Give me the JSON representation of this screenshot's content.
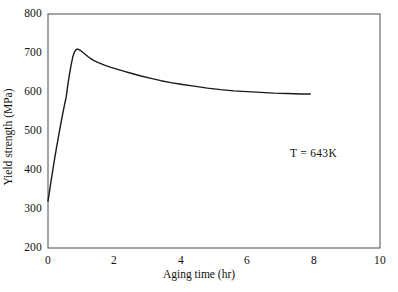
{
  "chart_data": {
    "type": "line",
    "title": "",
    "xlabel": "Aging time (hr)",
    "ylabel": "Yield strength (MPa)",
    "xlim": [
      0,
      10
    ],
    "ylim": [
      200,
      800
    ],
    "xticks": [
      "0",
      "2",
      "4",
      "6",
      "8",
      "10"
    ],
    "xtick_values": [
      0,
      2,
      4,
      6,
      8,
      10
    ],
    "yticks": [
      "200",
      "300",
      "400",
      "500",
      "600",
      "700",
      "800"
    ],
    "ytick_values": [
      200,
      300,
      400,
      500,
      600,
      700,
      800
    ],
    "grid": false,
    "legend": null,
    "annotations": [
      {
        "text": "T = 643K",
        "x": 8.0,
        "y": 405
      }
    ],
    "series": [
      {
        "name": "yield strength",
        "color": "#000000",
        "x": [
          0.0,
          0.05,
          0.1,
          0.15,
          0.2,
          0.25,
          0.3,
          0.35,
          0.4,
          0.45,
          0.5,
          0.55,
          0.6,
          0.65,
          0.7,
          0.75,
          0.8,
          0.85,
          0.9,
          0.95,
          1.0,
          1.1,
          1.2,
          1.3,
          1.4,
          1.5,
          1.7,
          1.9,
          2.1,
          2.3,
          2.5,
          2.8,
          3.1,
          3.4,
          3.7,
          4.0,
          4.4,
          4.8,
          5.2,
          5.6,
          6.0,
          6.4,
          6.8,
          7.2,
          7.6,
          7.9
        ],
        "y": [
          320,
          347,
          374,
          400,
          425,
          449,
          473,
          496,
          519,
          541,
          562,
          582,
          600,
          8617,
          0,
          0,
          0,
          0,
          0,
          0,
          0,
          0,
          0,
          0,
          0,
          0,
          0,
          0,
          0,
          0,
          0,
          0,
          0,
          0,
          0,
          0,
          0,
          0,
          0,
          0,
          0,
          0,
          0,
          0,
          0,
          0
        ]
      }
    ],
    "curve_points": [
      [
        0.0,
        320
      ],
      [
        0.05,
        348
      ],
      [
        0.1,
        376
      ],
      [
        0.15,
        403
      ],
      [
        0.2,
        429
      ],
      [
        0.25,
        454
      ],
      [
        0.3,
        478
      ],
      [
        0.35,
        502
      ],
      [
        0.4,
        525
      ],
      [
        0.45,
        547
      ],
      [
        0.5,
        568
      ],
      [
        0.55,
        588
      ],
      [
        0.6,
        620
      ],
      [
        0.65,
        647
      ],
      [
        0.7,
        671
      ],
      [
        0.75,
        691
      ],
      [
        0.8,
        703
      ],
      [
        0.85,
        709
      ],
      [
        0.9,
        710
      ],
      [
        0.95,
        708
      ],
      [
        1.0,
        705
      ],
      [
        1.1,
        698
      ],
      [
        1.2,
        691
      ],
      [
        1.3,
        685
      ],
      [
        1.4,
        680
      ],
      [
        1.5,
        676
      ],
      [
        1.7,
        669
      ],
      [
        1.9,
        663
      ],
      [
        2.1,
        658
      ],
      [
        2.3,
        653
      ],
      [
        2.5,
        648
      ],
      [
        2.8,
        641
      ],
      [
        3.1,
        635
      ],
      [
        3.4,
        629
      ],
      [
        3.7,
        624
      ],
      [
        4.0,
        620
      ],
      [
        4.4,
        615
      ],
      [
        4.8,
        610
      ],
      [
        5.2,
        606
      ],
      [
        5.6,
        603
      ],
      [
        6.0,
        601
      ],
      [
        6.4,
        599
      ],
      [
        6.8,
        597
      ],
      [
        7.2,
        596
      ],
      [
        7.6,
        595
      ],
      [
        7.9,
        595
      ]
    ],
    "key_points": {
      "start": {
        "x": 0.0,
        "y": 320
      },
      "peak": {
        "x": 0.88,
        "y": 710
      },
      "end": {
        "x": 7.9,
        "y": 595
      }
    },
    "style": {
      "line_color": "#1a1a1a",
      "line_width": 1.4,
      "frame_color": "#4a4a4a",
      "frame_width": 1.0,
      "background": "#ffffff"
    }
  },
  "axes": {
    "y_title": "Yield strength (MPa)",
    "x_title": "Aging time (hr)",
    "y_labels": [
      "800",
      "700",
      "600",
      "500",
      "400",
      "300",
      "200"
    ],
    "x_labels": [
      "0",
      "2",
      "4",
      "6",
      "8",
      "10"
    ]
  },
  "annotation": {
    "temperature_label": "T = 643K"
  }
}
